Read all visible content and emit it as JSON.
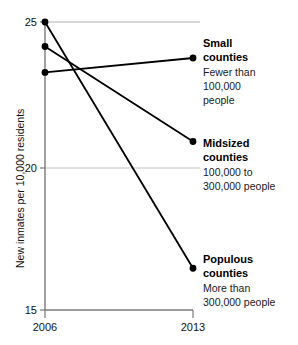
{
  "chart_data": {
    "type": "line",
    "title": "",
    "subtitle": "",
    "xlabel": "",
    "ylabel": "New inmates per 10,000 residents",
    "x": [
      "2006",
      "2013"
    ],
    "xtick_labels": [
      "2006",
      "2013"
    ],
    "ytick_labels": [
      "25",
      "20",
      "15"
    ],
    "yticks": [
      25,
      20,
      15
    ],
    "ylim": [
      15,
      25
    ],
    "grid": "horizontal gridlines at y=25 and y=20; baseline axis at y=15",
    "legend_position": "right of 2013 endpoints, inline annotations",
    "series": [
      {
        "name": "Small counties",
        "values": [
          23.25,
          23.75
        ],
        "label_head_line1": "Small",
        "label_head_line2": "counties",
        "label_sub_line1": "Fewer than",
        "label_sub_line2": "100,000",
        "label_sub_line3": "people",
        "color": "#000000"
      },
      {
        "name": "Midsized counties",
        "values": [
          24.15,
          20.85
        ],
        "label_head_line1": "Midsized",
        "label_head_line2": "counties",
        "label_sub_line1": "100,000 to",
        "label_sub_line2": "300,000 people",
        "label_sub_line3": "",
        "color": "#000000"
      },
      {
        "name": "Populous counties",
        "values": [
          25.0,
          16.45
        ],
        "label_head_line1": "Populous",
        "label_head_line2": "counties",
        "label_sub_line1": "More than",
        "label_sub_line2": "300,000 people",
        "label_sub_line3": "",
        "color": "#000000"
      }
    ]
  },
  "colors": {
    "line": "#000000",
    "marker": "#000000",
    "gridline": "#b8b8b8",
    "axis": "#555555",
    "text": "#111111"
  }
}
